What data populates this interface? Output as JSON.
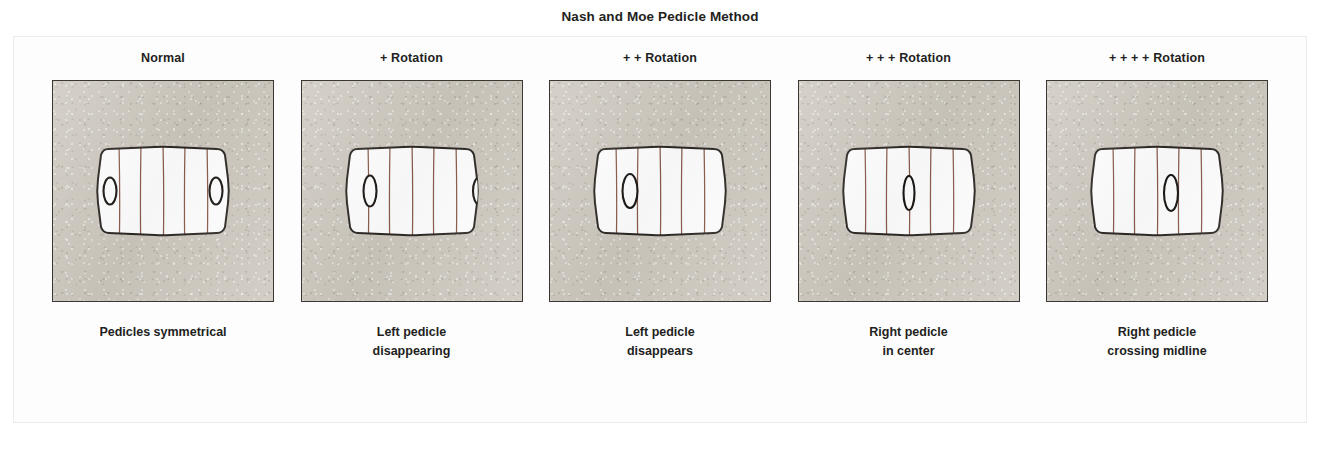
{
  "figure": {
    "title": "Nash and Moe Pedicle Method",
    "colors": {
      "film_background": "#cdc8be",
      "film_border": "#3b3732",
      "vertebra_fill": "#ffffff",
      "vertebra_outline": "#2b2622",
      "trabecular_line": "#8a5a4a",
      "pedicle_outline": "#1a1613",
      "text": "#231f1d",
      "page_background": "#ffffff"
    }
  },
  "panels": [
    {
      "id": "normal",
      "header": "Normal",
      "caption": "Pedicles symmetrical",
      "grade": 0,
      "pedicles": [
        {
          "side": "left",
          "cx": 15,
          "cy": 52,
          "rx": 6.5,
          "ry": 13.5,
          "clipped": false
        },
        {
          "side": "right",
          "cx": 121,
          "cy": 52,
          "rx": 6.5,
          "ry": 13.5,
          "clipped": false
        }
      ]
    },
    {
      "id": "rotation-1",
      "header": "+ Rotation",
      "caption": "Left pedicle\ndisappearing",
      "grade": 1,
      "pedicles": [
        {
          "side": "left",
          "cx": 26,
          "cy": 52,
          "rx": 6.5,
          "ry": 15.5,
          "clipped": false
        },
        {
          "side": "right",
          "cx": 135,
          "cy": 52,
          "rx": 6.0,
          "ry": 13.5,
          "clipped": true
        }
      ]
    },
    {
      "id": "rotation-2",
      "header": "+ + Rotation",
      "caption": "Left pedicle\ndisappears",
      "grade": 2,
      "pedicles": [
        {
          "side": "left",
          "cx": 38,
          "cy": 52,
          "rx": 7.5,
          "ry": 17.0,
          "clipped": false
        }
      ]
    },
    {
      "id": "rotation-3",
      "header": "+ + + Rotation",
      "caption": "Right pedicle\nin center",
      "grade": 3,
      "pedicles": [
        {
          "side": "center",
          "cx": 68,
          "cy": 54,
          "rx": 5.5,
          "ry": 17.0,
          "clipped": false
        }
      ]
    },
    {
      "id": "rotation-4",
      "header": "+ + + + Rotation",
      "caption": "Right pedicle\ncrossing midline",
      "grade": 4,
      "pedicles": [
        {
          "side": "right",
          "cx": 82,
          "cy": 54,
          "rx": 7.0,
          "ry": 18.0,
          "clipped": false
        }
      ]
    }
  ]
}
